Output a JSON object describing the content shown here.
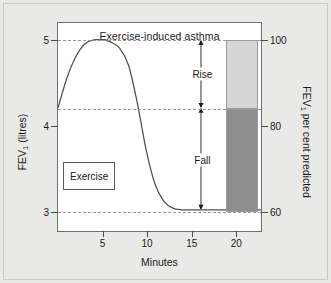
{
  "figure": {
    "background_color": "#e9e9e7",
    "plot_background_color": "#ffffff"
  },
  "chart_data": {
    "type": "line",
    "title": "Exercise-induced asthma",
    "xlabel": "Minutes",
    "ylabel": "FEV₁ (litres)",
    "ylabel_right": "FEV₁ per cent predicted",
    "xlim": [
      0,
      23
    ],
    "ylim": [
      55,
      104
    ],
    "grid": true,
    "legend": "none",
    "x_ticks": [
      5,
      10,
      15,
      20
    ],
    "x_tick_labels": [
      "5",
      "10",
      "15",
      "20"
    ],
    "y_ticks_left": [
      100,
      80,
      60
    ],
    "y_tick_labels_left": [
      "5",
      "4",
      "3"
    ],
    "y_ticks_right": [
      100,
      80,
      60
    ],
    "y_tick_labels_right": [
      "100",
      "80",
      "60"
    ],
    "gridline_values": [
      100,
      84,
      60
    ],
    "baseline_percent": 84,
    "series": [
      {
        "name": "FEV1 per cent predicted",
        "x": [
          0,
          1,
          2,
          3,
          4,
          5,
          6,
          7,
          8,
          9,
          10,
          11,
          12,
          13,
          14,
          15,
          16,
          17,
          18,
          19,
          20,
          21,
          22,
          23
        ],
        "values": [
          84,
          91,
          96,
          99,
          100,
          100,
          99.5,
          98,
          94,
          85,
          74,
          66,
          62,
          60.4,
          60,
          60,
          60,
          60,
          60,
          60,
          60,
          60,
          60,
          60
        ]
      }
    ],
    "annotations": [
      {
        "label": "Rise",
        "type": "double-arrow",
        "x": 16.2,
        "from_value": 84,
        "to_value": 100
      },
      {
        "label": "Fall",
        "type": "double-arrow",
        "x": 16.2,
        "from_value": 60,
        "to_value": 84
      },
      {
        "label": "Exercise",
        "type": "box",
        "x_start": 0.6,
        "x_end": 6.4,
        "value_top": 71.5,
        "value_bottom": 65.0
      }
    ],
    "bar": {
      "name": "Rise and fall magnitude",
      "x_start": 18.8,
      "x_end": 22.4,
      "segments": [
        {
          "name": "Rise",
          "from_value": 84,
          "to_value": 100,
          "color": "#d6d6d6"
        },
        {
          "name": "Fall",
          "from_value": 60,
          "to_value": 84,
          "color": "#8e8e8e"
        }
      ]
    }
  },
  "labels": {
    "rise": "Rise",
    "fall": "Fall",
    "exercise": "Exercise",
    "title": "Exercise-induced asthma",
    "x_axis_title": "Minutes"
  }
}
